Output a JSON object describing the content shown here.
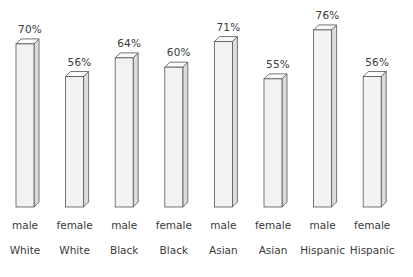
{
  "chart_data": {
    "type": "bar",
    "title": "",
    "subtitle": "",
    "xlabel": "",
    "ylabel": "",
    "ylim": [
      0,
      100
    ],
    "grid": false,
    "legend": "none",
    "categories": [
      "White male",
      "White female",
      "Black male",
      "Black female",
      "Asian male",
      "Asian female",
      "Hispanic male",
      "Hispanic female"
    ],
    "values": [
      70,
      56,
      64,
      60,
      71,
      55,
      76,
      56
    ],
    "value_labels": [
      "70%",
      "56%",
      "64%",
      "60%",
      "71%",
      "55%",
      "76%",
      "56%"
    ],
    "group_labels_gender": [
      "male",
      "female",
      "male",
      "female",
      "male",
      "female",
      "male",
      "female"
    ],
    "group_labels_race": [
      "White",
      "White",
      "Black",
      "Black",
      "Asian",
      "Asian",
      "Hispanic",
      "Hispanic"
    ],
    "bars": [
      {
        "label": "70%",
        "value": 70,
        "gender": "male",
        "race": "White"
      },
      {
        "label": "56%",
        "value": 56,
        "gender": "female",
        "race": "White"
      },
      {
        "label": "64%",
        "value": 64,
        "gender": "male",
        "race": "Black"
      },
      {
        "label": "60%",
        "value": 60,
        "gender": "female",
        "race": "Black"
      },
      {
        "label": "71%",
        "value": 71,
        "gender": "male",
        "race": "Asian"
      },
      {
        "label": "55%",
        "value": 55,
        "gender": "female",
        "race": "Asian"
      },
      {
        "label": "76%",
        "value": 76,
        "gender": "male",
        "race": "Hispanic"
      },
      {
        "label": "56%",
        "value": 56,
        "gender": "female",
        "race": "Hispanic"
      }
    ],
    "colors": {
      "background": "#ffffff",
      "bar_front": "#f2f2f2",
      "bar_side": "#dcdcdc",
      "bar_top": "#fafafa",
      "bar_outline": "#555555",
      "text": "#3a3a3a"
    }
  }
}
